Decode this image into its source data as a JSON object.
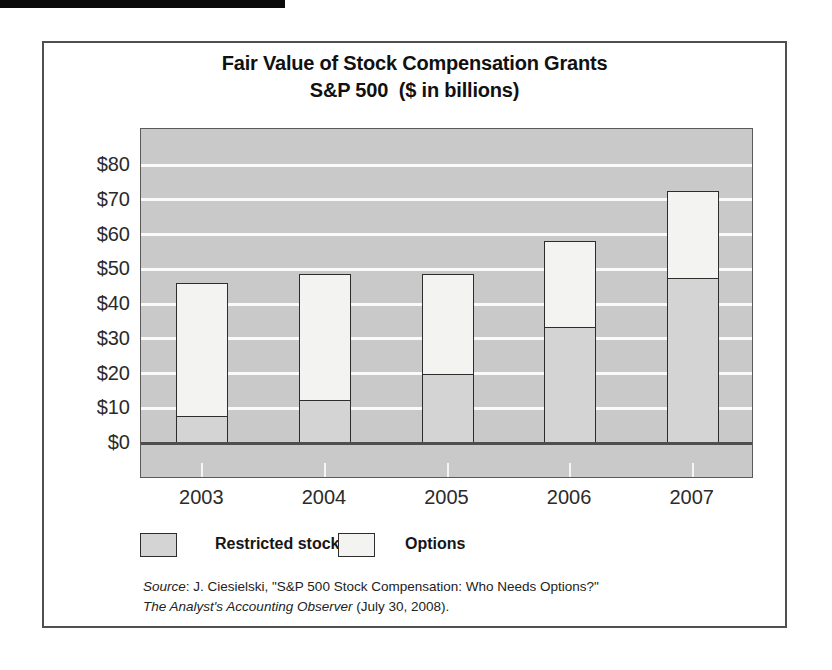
{
  "title": {
    "line1": "Fair Value of Stock Compensation Grants",
    "line2": "S&P 500  ($ in billions)"
  },
  "chart_data": {
    "type": "bar",
    "stacked": true,
    "categories": [
      "2003",
      "2004",
      "2005",
      "2006",
      "2007"
    ],
    "series": [
      {
        "name": "Restricted stock",
        "color": "#d4d4d4",
        "values": [
          8,
          12.5,
          20,
          33.5,
          47.5
        ]
      },
      {
        "name": "Options",
        "color": "#f3f3f1",
        "values": [
          38,
          36,
          28.5,
          24.5,
          25
        ]
      }
    ],
    "totals": [
      46,
      48.5,
      48.5,
      58,
      72.5
    ],
    "ytick_labels": [
      "$0",
      "$10",
      "$20",
      "$30",
      "$40",
      "$50",
      "$60",
      "$70",
      "$80"
    ],
    "ytick_values": [
      0,
      10,
      20,
      30,
      40,
      50,
      60,
      70,
      80
    ],
    "ylim": [
      0,
      88
    ],
    "grid": "horizontal-white-on-gray",
    "legend_position": "bottom-left",
    "plot_bg": "#c9c9c9",
    "title": "Fair Value of Stock Compensation Grants S&P 500 ($ in billions)"
  },
  "source": {
    "label_italic": "Source",
    "line1_rest": ": J. Ciesielski, \"S&P 500 Stock Compensation: Who Needs Options?\"",
    "line2_italic": "The Analyst's Accounting Observer",
    "line2_rest": " (July 30, 2008)."
  },
  "colors": {
    "frame_border": "#4f4f4f",
    "plot_background": "#c9c9c9",
    "gridline": "#fafafa",
    "restricted_fill": "#d4d4d4",
    "options_fill": "#f3f3f1",
    "bar_border": "#2d2d2d",
    "axis_line": "#4e4e4e",
    "text": "#1c1c1c"
  }
}
